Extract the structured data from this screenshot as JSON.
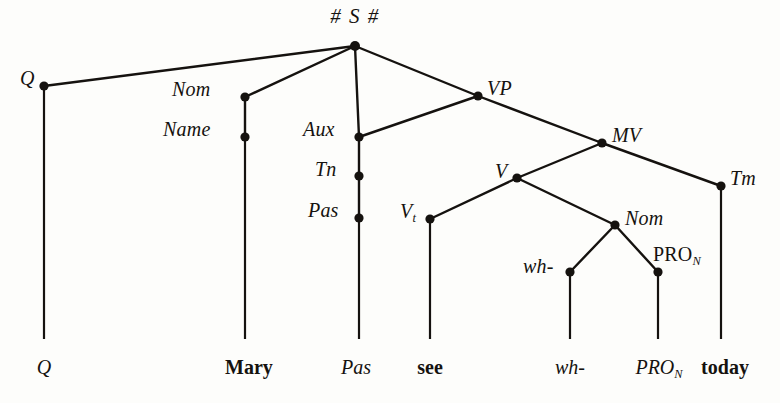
{
  "figure": {
    "kind": "syntax-tree-diagram",
    "ink_color": "#15120f",
    "background_color": "#fdfdfb",
    "width": 780,
    "height": 403
  },
  "root": {
    "label": "# S #",
    "x": 355,
    "y": 46
  },
  "nodes": [
    {
      "id": "q",
      "label": "Q",
      "sub": "",
      "x": 44,
      "y": 86,
      "label_x": 20,
      "label_y": 68,
      "style": "italic",
      "align": "right-of-left"
    },
    {
      "id": "nom1",
      "label": "Nom",
      "sub": "",
      "x": 245,
      "y": 97,
      "label_x": 172,
      "label_y": 79,
      "style": "italic",
      "align": "left-of-node"
    },
    {
      "id": "name",
      "label": "Name",
      "sub": "",
      "x": 245,
      "y": 137,
      "label_x": 163,
      "label_y": 119,
      "style": "italic",
      "align": "left-of-node"
    },
    {
      "id": "aux",
      "label": "Aux",
      "sub": "",
      "x": 359,
      "y": 137,
      "label_x": 303,
      "label_y": 119,
      "style": "italic",
      "align": "left-of-node"
    },
    {
      "id": "tn",
      "label": "Tn",
      "sub": "",
      "x": 359,
      "y": 176,
      "label_x": 315,
      "label_y": 159,
      "style": "italic",
      "align": "left-of-node"
    },
    {
      "id": "pas",
      "label": "Pas",
      "sub": "",
      "x": 359,
      "y": 218,
      "label_x": 308,
      "label_y": 200,
      "style": "italic",
      "align": "left-of-node"
    },
    {
      "id": "vp",
      "label": "VP",
      "sub": "",
      "x": 478,
      "y": 96,
      "label_x": 487,
      "label_y": 78,
      "style": "italic",
      "align": "right-of-node"
    },
    {
      "id": "mv",
      "label": "MV",
      "sub": "",
      "x": 602,
      "y": 143,
      "label_x": 612,
      "label_y": 125,
      "style": "italic",
      "align": "right-of-node"
    },
    {
      "id": "v",
      "label": "V",
      "sub": "",
      "x": 517,
      "y": 178,
      "label_x": 495,
      "label_y": 161,
      "style": "italic",
      "align": "left-of-node"
    },
    {
      "id": "vt",
      "label": "V",
      "sub": "t",
      "x": 430,
      "y": 219,
      "label_x": 400,
      "label_y": 201,
      "style": "italic",
      "align": "left-of-node"
    },
    {
      "id": "tm",
      "label": "Tm",
      "sub": "",
      "x": 721,
      "y": 186,
      "label_x": 730,
      "label_y": 168,
      "style": "italic",
      "align": "right-of-node"
    },
    {
      "id": "nom2",
      "label": "Nom",
      "sub": "",
      "x": 615,
      "y": 225,
      "label_x": 625,
      "label_y": 208,
      "style": "italic",
      "align": "right-of-node"
    },
    {
      "id": "wh",
      "label": "wh-",
      "sub": "",
      "x": 570,
      "y": 272,
      "label_x": 523,
      "label_y": 256,
      "style": "italic",
      "align": "left-of-node"
    },
    {
      "id": "pron",
      "label": "PRO",
      "sub": "N",
      "x": 658,
      "y": 272,
      "label_x": 653,
      "label_y": 244,
      "style": "upright",
      "align": "above-right"
    }
  ],
  "edges": [
    {
      "from": "root",
      "to": "q",
      "x1": 355,
      "y1": 46,
      "x2": 44,
      "y2": 86
    },
    {
      "from": "root",
      "to": "nom1",
      "x1": 355,
      "y1": 46,
      "x2": 245,
      "y2": 97
    },
    {
      "from": "root",
      "to": "aux",
      "x1": 355,
      "y1": 46,
      "x2": 359,
      "y2": 137
    },
    {
      "from": "root",
      "to": "vp",
      "x1": 355,
      "y1": 46,
      "x2": 478,
      "y2": 96
    },
    {
      "from": "nom1",
      "to": "name",
      "x1": 245,
      "y1": 97,
      "x2": 245,
      "y2": 137
    },
    {
      "from": "vp",
      "to": "aux",
      "x1": 478,
      "y1": 96,
      "x2": 359,
      "y2": 137
    },
    {
      "from": "vp",
      "to": "mv",
      "x1": 478,
      "y1": 96,
      "x2": 602,
      "y2": 143
    },
    {
      "from": "aux",
      "to": "tn",
      "x1": 359,
      "y1": 137,
      "x2": 359,
      "y2": 176
    },
    {
      "from": "tn",
      "to": "pas",
      "x1": 359,
      "y1": 176,
      "x2": 359,
      "y2": 218
    },
    {
      "from": "mv",
      "to": "v",
      "x1": 602,
      "y1": 143,
      "x2": 517,
      "y2": 178
    },
    {
      "from": "mv",
      "to": "tm",
      "x1": 602,
      "y1": 143,
      "x2": 721,
      "y2": 186
    },
    {
      "from": "v",
      "to": "vt",
      "x1": 517,
      "y1": 178,
      "x2": 430,
      "y2": 219
    },
    {
      "from": "v",
      "to": "nom2",
      "x1": 517,
      "y1": 178,
      "x2": 615,
      "y2": 225
    },
    {
      "from": "nom2",
      "to": "wh",
      "x1": 615,
      "y1": 225,
      "x2": 570,
      "y2": 272
    },
    {
      "from": "nom2",
      "to": "pron",
      "x1": 615,
      "y1": 225,
      "x2": 658,
      "y2": 272
    }
  ],
  "terminal_stems": [
    {
      "id": "stem-q",
      "x": 44,
      "y1": 86,
      "y2": 339
    },
    {
      "id": "stem-mary",
      "x": 245,
      "y1": 137,
      "y2": 339
    },
    {
      "id": "stem-pas",
      "x": 359,
      "y1": 218,
      "y2": 339
    },
    {
      "id": "stem-see",
      "x": 430,
      "y1": 219,
      "y2": 339
    },
    {
      "id": "stem-wh",
      "x": 570,
      "y1": 272,
      "y2": 339
    },
    {
      "id": "stem-pron",
      "x": 658,
      "y1": 272,
      "y2": 339
    },
    {
      "id": "stem-today",
      "x": 721,
      "y1": 186,
      "y2": 339
    }
  ],
  "terminals": [
    {
      "id": "term-q",
      "label": "Q",
      "sub": "",
      "x": 44,
      "y": 357,
      "style": "italic"
    },
    {
      "id": "term-mary",
      "label": "Mary",
      "sub": "",
      "x": 249,
      "y": 357,
      "style": "bold"
    },
    {
      "id": "term-pas",
      "label": "Pas",
      "sub": "",
      "x": 356,
      "y": 357,
      "style": "italic"
    },
    {
      "id": "term-see",
      "label": "see",
      "sub": "",
      "x": 430,
      "y": 357,
      "style": "bold"
    },
    {
      "id": "term-wh",
      "label": "wh-",
      "sub": "",
      "x": 570,
      "y": 357,
      "style": "italic"
    },
    {
      "id": "term-pron",
      "label": "PRO",
      "sub": "N",
      "x": 659,
      "y": 357,
      "style": "italic"
    },
    {
      "id": "term-today",
      "label": "today",
      "sub": "",
      "x": 725,
      "y": 357,
      "style": "bold"
    }
  ]
}
